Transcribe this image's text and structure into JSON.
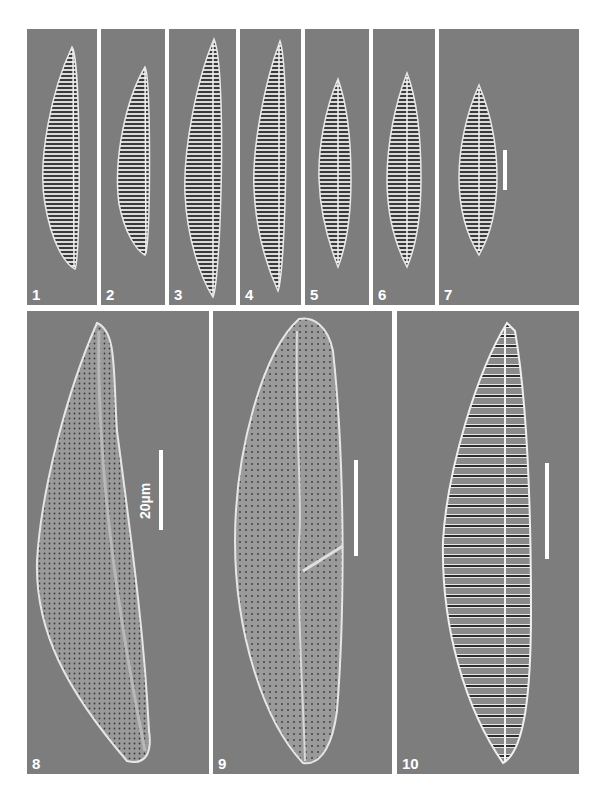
{
  "figure": {
    "background_color": "#7d7d7d",
    "divider_color": "#ffffff",
    "top_row": [
      {
        "label": "1"
      },
      {
        "label": "2"
      },
      {
        "label": "3"
      },
      {
        "label": "4"
      },
      {
        "label": "5"
      },
      {
        "label": "6"
      },
      {
        "label": "7"
      }
    ],
    "bottom_row": [
      {
        "label": "8",
        "scale_bar_text": "20µm"
      },
      {
        "label": "9"
      },
      {
        "label": "10"
      }
    ]
  }
}
